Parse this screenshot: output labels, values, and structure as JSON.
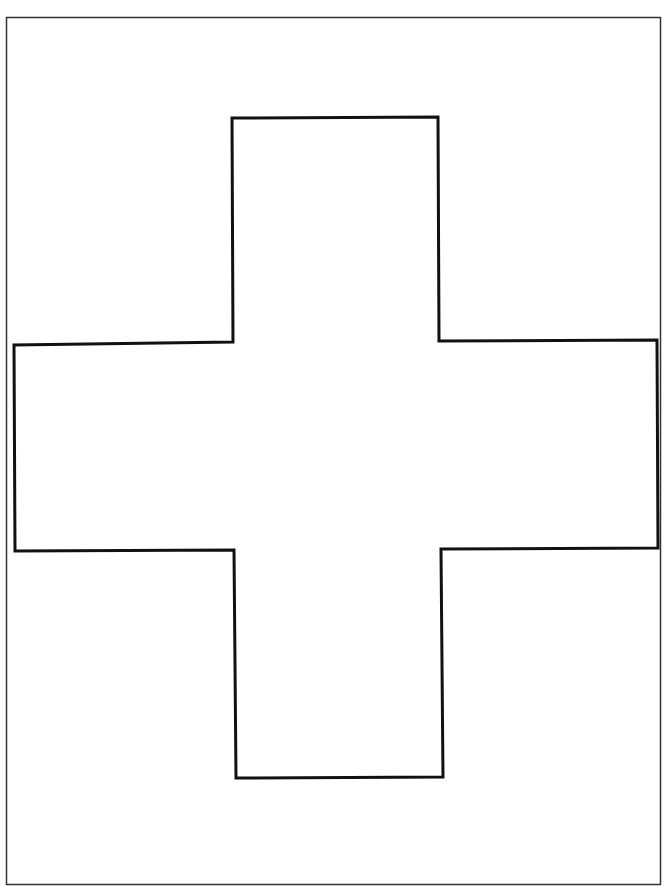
{
  "page": {
    "background": "#ffffff",
    "width": 671,
    "height": 886
  },
  "frame": {
    "x": 6.5,
    "y": 17.5,
    "width": 654,
    "height": 867,
    "stroke": "#333333",
    "stroke_width": 1.5
  },
  "cross": {
    "stroke": "#111111",
    "stroke_width": 3,
    "fill": "#ffffff",
    "points": "232,118 438,117 439,341 657,340 658,548 441,549 443,777 236,778 234,550 15,551 14,345 233,342"
  }
}
